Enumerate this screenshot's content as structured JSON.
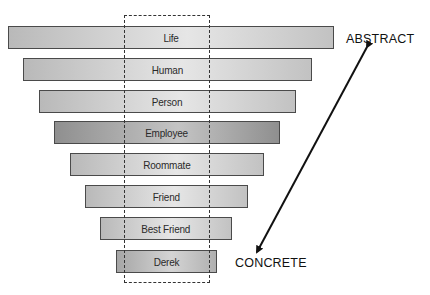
{
  "diagram": {
    "type": "abstraction-ladder",
    "bars": [
      {
        "label": "Life",
        "left": 8,
        "top": 26,
        "width": 326,
        "shade": "light"
      },
      {
        "label": "Human",
        "left": 23,
        "top": 58,
        "width": 289,
        "shade": "light"
      },
      {
        "label": "Person",
        "left": 39,
        "top": 90,
        "width": 257,
        "shade": "light"
      },
      {
        "label": "Employee",
        "left": 54,
        "top": 121,
        "width": 226,
        "shade": "dark"
      },
      {
        "label": "Roommate",
        "left": 70,
        "top": 153,
        "width": 194,
        "shade": "light"
      },
      {
        "label": "Friend",
        "left": 85,
        "top": 185,
        "width": 163,
        "shade": "light"
      },
      {
        "label": "Best Friend",
        "left": 100,
        "top": 217,
        "width": 132,
        "shade": "light"
      },
      {
        "label": "Derek",
        "left": 116,
        "top": 250,
        "width": 101,
        "shade": "mid"
      }
    ],
    "axis": {
      "top_label": "ABSTRACT",
      "bottom_label": "CONCRETE"
    },
    "colors": {
      "bar_light_start": "#b9b9b9",
      "bar_light_end": "#e6e6e6",
      "bar_dark_start": "#8f8f8f",
      "bar_dark_end": "#c4c4c4",
      "border": "#4a4a4a",
      "arrow": "#111111"
    }
  }
}
